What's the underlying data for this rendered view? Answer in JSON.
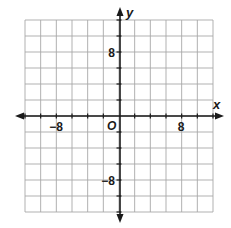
{
  "chart_data": {
    "type": "coordinate-plane",
    "title": "",
    "xlabel": "x",
    "ylabel": "y",
    "origin_label": "O",
    "xlim": [
      -12,
      12
    ],
    "ylim": [
      -12,
      12
    ],
    "grid": true,
    "grid_step": 2,
    "grid_cols": 12,
    "grid_rows": 12,
    "x_tick_labels": [
      {
        "value": -8,
        "text": "−8"
      },
      {
        "value": 8,
        "text": "8"
      }
    ],
    "y_tick_labels": [
      {
        "value": 8,
        "text": "8"
      },
      {
        "value": -8,
        "text": "−8"
      }
    ],
    "series": []
  },
  "colors": {
    "grid": "#a8a8a8",
    "axis": "#1a1a1a",
    "background": "#ffffff"
  }
}
